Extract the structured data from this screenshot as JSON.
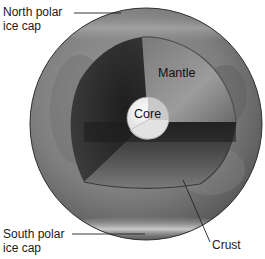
{
  "diagram": {
    "type": "cutaway-sphere",
    "layers": [
      {
        "id": "core",
        "label": "Core"
      },
      {
        "id": "mantle",
        "label": "Mantle"
      },
      {
        "id": "crust",
        "label": "Crust"
      }
    ],
    "surface_features": [
      {
        "id": "north-polar-ice-cap",
        "label_line1": "North polar",
        "label_line2": "ice cap"
      },
      {
        "id": "south-polar-ice-cap",
        "label_line1": "South polar",
        "label_line2": "ice cap"
      }
    ],
    "labels": {
      "north_line1": "North polar",
      "north_line2": "ice cap",
      "south_line1": "South polar",
      "south_line2": "ice cap",
      "mantle": "Mantle",
      "core": "Core",
      "crust": "Crust"
    },
    "colors": {
      "background": "#ffffff",
      "surface_light": "#a8a8a8",
      "surface_dark": "#555555",
      "mantle_left_face": "#2a2a2a",
      "mantle_right_face": "#8a8a8a",
      "mantle_bottom_face": "#6e6e6e",
      "core_light": "#f0f0f0",
      "core_shade": "#c4c4c4",
      "leader_line": "#222222"
    }
  }
}
